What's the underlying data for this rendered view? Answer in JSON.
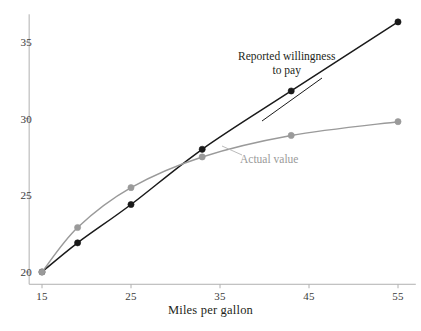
{
  "figure": {
    "background_color": "#ffffff",
    "axis_color": "#b0b0b0"
  },
  "chart_data": {
    "type": "line",
    "title": "",
    "subtitle": "",
    "xlabel": "Miles per gallon",
    "ylabel": "",
    "xlim": [
      13.5,
      57
    ],
    "ylim": [
      19.2,
      36.8
    ],
    "xticks": [
      15,
      25,
      35,
      45,
      55
    ],
    "xticklabels": [
      "15",
      "25",
      "35",
      "45",
      "55"
    ],
    "yticks": [
      20,
      25,
      30,
      35
    ],
    "yticklabels": [
      "20",
      "25",
      "30",
      "35"
    ],
    "grid": false,
    "legend": "inline-annotations",
    "x": [
      15,
      19,
      25,
      33,
      43,
      55
    ],
    "series": [
      {
        "name": "Reported willingness to pay",
        "color": "#1a1a1a",
        "marker": "circle",
        "values": [
          20.0,
          21.9,
          24.4,
          28.0,
          31.8,
          36.3
        ]
      },
      {
        "name": "Actual value",
        "color": "#9a9a9a",
        "marker": "circle",
        "values": [
          20.0,
          22.9,
          25.5,
          27.5,
          28.9,
          29.8
        ]
      }
    ],
    "annotations": [
      {
        "text_lines": [
          "Reported willingness",
          "to pay"
        ],
        "series": "Reported willingness to pay",
        "color": "#231f20"
      },
      {
        "text_lines": [
          "Actual value"
        ],
        "series": "Actual value",
        "color": "#9a9a9a"
      }
    ]
  },
  "axis": {
    "x_title": "Miles per gallon",
    "x_tick_labels": [
      "15",
      "25",
      "35",
      "45",
      "55"
    ],
    "y_tick_labels": [
      "20",
      "25",
      "30",
      "35"
    ]
  },
  "annotations": {
    "reported_line1": "Reported willingness",
    "reported_line2": "to pay",
    "actual": "Actual value"
  }
}
